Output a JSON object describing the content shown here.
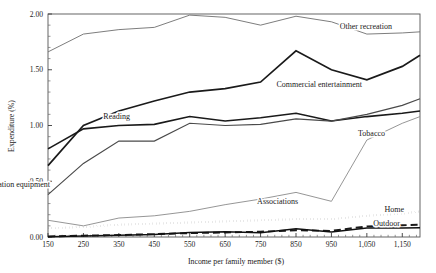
{
  "chart_data": {
    "type": "line",
    "title": "",
    "xlabel": "Income per family member ($)",
    "ylabel": "Expenditure (%)",
    "xlim": [
      150,
      1200
    ],
    "ylim": [
      0.0,
      2.0
    ],
    "grid": false,
    "legend": "inline-labels",
    "x_ticklabels": [
      "150",
      "250",
      "350",
      "450",
      "550",
      "650",
      "750",
      "850",
      "950",
      "1,050",
      "1,150"
    ],
    "x_tickvalues": [
      150,
      250,
      350,
      450,
      550,
      650,
      750,
      850,
      950,
      1050,
      1150
    ],
    "y_ticklabels": [
      "0.00",
      "0.50",
      "1.00",
      "1.50",
      "2.00"
    ],
    "y_tickvalues": [
      0.0,
      0.5,
      1.0,
      1.5,
      2.0
    ],
    "x": [
      150,
      250,
      350,
      450,
      550,
      650,
      750,
      850,
      950,
      1050,
      1150,
      1200
    ],
    "series": [
      {
        "name": "Other recreation",
        "label": "Other recreation",
        "style": "solid-thin",
        "color": "#6e6e6e",
        "width": 0.9,
        "values": [
          1.66,
          1.82,
          1.86,
          1.88,
          1.99,
          1.97,
          1.9,
          1.98,
          1.93,
          1.82,
          1.83,
          1.84
        ],
        "label_x": 392,
        "label_y": 29
      },
      {
        "name": "Commercial entertainment",
        "label": "Commercial entertainment",
        "style": "solid-thick",
        "color": "#1a1a1a",
        "width": 1.7,
        "values": [
          0.64,
          1.0,
          1.13,
          1.22,
          1.3,
          1.33,
          1.39,
          1.67,
          1.5,
          1.41,
          1.53,
          1.63
        ],
        "label_x": 362,
        "label_y": 87
      },
      {
        "name": "Reading",
        "label": "Reading",
        "style": "solid-thick",
        "color": "#1a1a1a",
        "width": 1.6,
        "values": [
          0.79,
          0.97,
          1.0,
          1.01,
          1.08,
          1.04,
          1.07,
          1.11,
          1.04,
          1.08,
          1.11,
          1.13
        ],
        "label_x": 130,
        "label_y": 119
      },
      {
        "name": "Tobacco",
        "label": "Tobacco",
        "style": "solid-medium",
        "color": "#4a4a4a",
        "width": 1.2,
        "values": [
          0.38,
          0.66,
          0.86,
          0.86,
          1.02,
          1.0,
          1.01,
          1.06,
          1.04,
          1.1,
          1.18,
          1.24
        ],
        "label_x": 385,
        "label_y": 136
      },
      {
        "name": "Recreation equipment",
        "label": "Recreation equipment",
        "style": "solid-thin",
        "color": "#8a8a8a",
        "width": 0.9,
        "values": [
          0.15,
          0.1,
          0.17,
          0.19,
          0.23,
          0.29,
          0.34,
          0.4,
          0.32,
          0.87,
          1.02,
          1.08
        ],
        "label_x": 50,
        "label_y": 187
      },
      {
        "name": "Associations",
        "label": "Associations",
        "style": "dotted",
        "color": "#111111",
        "width": 2.2,
        "values": [
          0.08,
          0.09,
          0.11,
          0.12,
          0.13,
          0.14,
          0.15,
          0.16,
          0.16,
          0.19,
          0.21,
          0.23
        ],
        "label_x": 298,
        "label_y": 204
      },
      {
        "name": "Home",
        "label": "Home",
        "style": "dashed",
        "color": "#1a1a1a",
        "width": 1.9,
        "values": [
          0.005,
          0.012,
          0.018,
          0.026,
          0.035,
          0.04,
          0.048,
          0.06,
          0.055,
          0.095,
          0.105,
          0.11
        ],
        "label_x": 404,
        "label_y": 212
      },
      {
        "name": "Outdoor",
        "label": "Outdoor",
        "style": "solid-thick",
        "color": "#111111",
        "width": 1.5,
        "values": [
          0.003,
          0.008,
          0.015,
          0.022,
          0.04,
          0.048,
          0.038,
          0.075,
          0.045,
          0.08,
          0.08,
          0.082
        ],
        "label_x": 400,
        "label_y": 226
      }
    ]
  }
}
